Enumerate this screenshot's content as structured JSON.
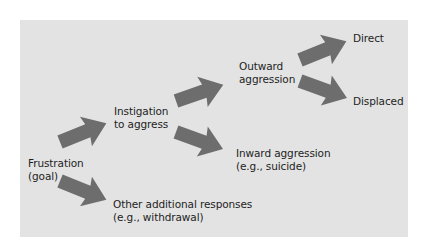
{
  "diagram": {
    "background_color": "#e3e3e3",
    "arrow_color": "#6d6d6d",
    "text_color": "#1e1e1e",
    "nodes": {
      "frustration": {
        "line1": "Frustration",
        "line2": "(goal)"
      },
      "instigation": {
        "line1": "Instigation",
        "line2": "to aggress"
      },
      "other": {
        "line1": "Other additional responses",
        "line2": "(e.g., withdrawal)"
      },
      "outward": {
        "line1": "Outward",
        "line2": "aggression"
      },
      "inward": {
        "line1": "Inward aggression",
        "line2": "(e.g., suicide)"
      },
      "direct": {
        "line1": "Direct"
      },
      "displaced": {
        "line1": "Displaced"
      }
    },
    "edges": [
      {
        "from": "Frustration (goal)",
        "to": "Instigation to aggress"
      },
      {
        "from": "Frustration (goal)",
        "to": "Other additional responses (e.g., withdrawal)"
      },
      {
        "from": "Instigation to aggress",
        "to": "Outward aggression"
      },
      {
        "from": "Instigation to aggress",
        "to": "Inward aggression (e.g., suicide)"
      },
      {
        "from": "Outward aggression",
        "to": "Direct"
      },
      {
        "from": "Outward aggression",
        "to": "Displaced"
      }
    ]
  }
}
